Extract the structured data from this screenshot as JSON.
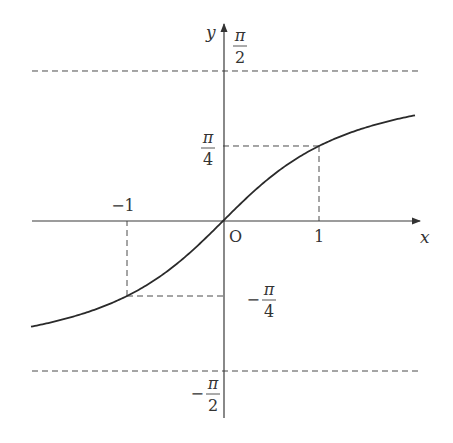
{
  "chart_data": {
    "type": "line",
    "title": "",
    "function": "y = arctan x",
    "xlabel": "x",
    "ylabel": "y",
    "origin_label": "O",
    "x_range": [
      -2.0,
      2.0
    ],
    "ylim": [
      -1.5708,
      1.5708
    ],
    "grid": false,
    "legend": null,
    "series": [
      {
        "name": "arctan x",
        "x": [
          -2.0,
          -1.5,
          -1.0,
          -0.5,
          -0.25,
          0,
          0.25,
          0.5,
          1.0,
          1.5,
          2.0
        ],
        "y": [
          -1.107,
          -0.983,
          -0.785,
          -0.464,
          -0.245,
          0,
          0.245,
          0.464,
          0.785,
          0.983,
          1.107
        ]
      }
    ],
    "x_ticks": [
      {
        "value": -1,
        "label": "−1"
      },
      {
        "value": 1,
        "label": "1"
      }
    ],
    "y_ticks": [
      {
        "value": 1.5708,
        "num": "π",
        "den": "2",
        "sign": ""
      },
      {
        "value": 0.7854,
        "num": "π",
        "den": "4",
        "sign": ""
      },
      {
        "value": -0.7854,
        "num": "π",
        "den": "4",
        "sign": "−"
      },
      {
        "value": -1.5708,
        "num": "π",
        "den": "2",
        "sign": "−"
      }
    ],
    "asymptotes": [
      {
        "y": 1.5708,
        "label": "y = π/2",
        "style": "dashed"
      },
      {
        "y": -1.5708,
        "label": "y = −π/2",
        "style": "dashed"
      }
    ],
    "guides": [
      {
        "point": [
          1,
          0.7854
        ],
        "style": "dashed"
      },
      {
        "point": [
          -1,
          -0.7854
        ],
        "style": "dashed"
      }
    ]
  },
  "layout": {
    "origin_px": [
      223,
      221
    ],
    "x_scale": 96,
    "y_scale": 95.5,
    "x_axis_px": [
      32,
      420
    ],
    "y_axis_px": [
      24,
      418
    ],
    "asymptote_px_x": [
      32,
      420
    ]
  },
  "colors": {
    "background": "#ffffff",
    "ink": "#2a2a2a"
  }
}
